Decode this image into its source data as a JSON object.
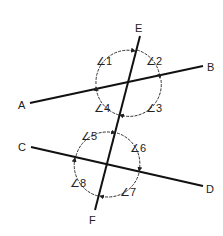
{
  "diagram": {
    "type": "geometry-transversal",
    "points": {
      "A": {
        "label": "A",
        "line": [
          30,
          103
        ]
      },
      "B": {
        "label": "B",
        "line": [
          203,
          66
        ]
      },
      "C": {
        "label": "C",
        "line": [
          31,
          147
        ]
      },
      "D": {
        "label": "D",
        "line": [
          203,
          186
        ]
      },
      "E": {
        "label": "E",
        "line": [
          140,
          36
        ]
      },
      "F": {
        "label": "F",
        "line": [
          95,
          210
        ]
      }
    },
    "lines": [
      {
        "name": "AB",
        "from": "A",
        "to": "B"
      },
      {
        "name": "CD",
        "from": "C",
        "to": "D"
      },
      {
        "name": "EF",
        "from": "E",
        "to": "F"
      }
    ],
    "intersections": [
      {
        "name": "top",
        "lines": [
          "AB",
          "EF"
        ],
        "at": [
          128,
          83
        ],
        "angles": [
          "∠1",
          "∠2",
          "∠3",
          "∠4"
        ]
      },
      {
        "name": "bottom",
        "lines": [
          "CD",
          "EF"
        ],
        "at": [
          107,
          164
        ],
        "angles": [
          "∠5",
          "∠6",
          "∠7",
          "∠8"
        ]
      }
    ],
    "angle_labels": [
      {
        "text": "∠1",
        "x": 98,
        "y": 64
      },
      {
        "text": "∠2",
        "x": 147,
        "y": 64
      },
      {
        "text": "∠3",
        "x": 146,
        "y": 111
      },
      {
        "text": "∠4",
        "x": 96,
        "y": 111
      },
      {
        "text": "∠5",
        "x": 82,
        "y": 139
      },
      {
        "text": "∠6",
        "x": 132,
        "y": 151
      },
      {
        "text": "∠7",
        "x": 121,
        "y": 195
      },
      {
        "text": "∠8",
        "x": 72,
        "y": 186
      }
    ]
  }
}
